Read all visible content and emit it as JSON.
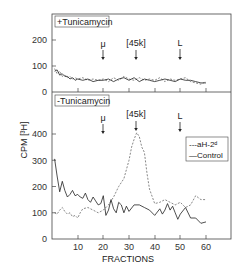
{
  "chart_data": [
    {
      "type": "line",
      "panel": "upper",
      "title": "+Tunicamycin",
      "xlabel": "",
      "ylabel": "CPM [3H]",
      "ylim": [
        0,
        280
      ],
      "yticks": [
        0,
        100,
        200
      ],
      "xlim": [
        0,
        70
      ],
      "markers": [
        {
          "label": "μ",
          "x": 20
        },
        {
          "label": "[45k]",
          "x": 33
        },
        {
          "label": "L",
          "x": 50
        }
      ],
      "series": [
        {
          "name": "anti-H-2d",
          "style": "dashed",
          "x": [
            1,
            2,
            3,
            4,
            5,
            6,
            7,
            8,
            9,
            10,
            12,
            14,
            16,
            18,
            20,
            22,
            24,
            26,
            28,
            30,
            32,
            34,
            36,
            38,
            40,
            42,
            44,
            46,
            48,
            50,
            52,
            54,
            56,
            58,
            60
          ],
          "values": [
            90,
            70,
            80,
            60,
            65,
            55,
            60,
            50,
            55,
            50,
            55,
            45,
            50,
            45,
            50,
            40,
            55,
            45,
            60,
            50,
            45,
            55,
            45,
            50,
            45,
            55,
            40,
            50,
            45,
            50,
            55,
            40,
            35,
            30,
            40
          ]
        },
        {
          "name": "Control",
          "style": "solid",
          "x": [
            1,
            2,
            3,
            4,
            5,
            6,
            7,
            8,
            9,
            10,
            12,
            14,
            16,
            18,
            20,
            22,
            24,
            26,
            28,
            30,
            32,
            34,
            36,
            38,
            40,
            42,
            44,
            46,
            48,
            50,
            52,
            54,
            56,
            58,
            60
          ],
          "values": [
            80,
            85,
            65,
            70,
            60,
            60,
            50,
            55,
            45,
            50,
            45,
            50,
            40,
            45,
            45,
            50,
            40,
            50,
            55,
            45,
            55,
            40,
            50,
            45,
            40,
            45,
            50,
            45,
            40,
            50,
            45,
            45,
            40,
            35,
            35
          ]
        }
      ]
    },
    {
      "type": "line",
      "panel": "lower",
      "title": "-Tunicamycin",
      "xlabel": "FRACTIONS",
      "ylabel": "CPM [3H]",
      "ylim": [
        0,
        500
      ],
      "yticks": [
        0,
        100,
        200,
        300,
        400
      ],
      "xticks": [
        10,
        20,
        30,
        40,
        50,
        60
      ],
      "xlim": [
        0,
        70
      ],
      "markers": [
        {
          "label": "μ",
          "x": 20
        },
        {
          "label": "[45k]",
          "x": 33
        },
        {
          "label": "L",
          "x": 50
        }
      ],
      "legend": [
        "aH-2d",
        "Control"
      ],
      "series": [
        {
          "name": "aH-2d",
          "style": "dashed",
          "x": [
            1,
            2,
            3,
            4,
            5,
            6,
            7,
            8,
            9,
            10,
            11,
            12,
            14,
            16,
            18,
            20,
            22,
            24,
            26,
            28,
            30,
            31,
            32,
            33,
            34,
            35,
            36,
            37,
            38,
            40,
            42,
            44,
            46,
            48,
            50,
            52,
            54,
            56,
            58,
            60
          ],
          "values": [
            100,
            95,
            110,
            120,
            105,
            95,
            100,
            85,
            90,
            80,
            100,
            115,
            120,
            110,
            100,
            110,
            130,
            160,
            200,
            230,
            300,
            350,
            380,
            405,
            390,
            350,
            330,
            250,
            190,
            135,
            140,
            150,
            140,
            130,
            140,
            120,
            130,
            165,
            150,
            150
          ]
        },
        {
          "name": "Control",
          "style": "solid",
          "x": [
            1,
            2,
            3,
            4,
            5,
            6,
            7,
            8,
            9,
            10,
            11,
            12,
            13,
            14,
            15,
            16,
            17,
            18,
            19,
            20,
            21,
            22,
            23,
            24,
            25,
            26,
            27,
            28,
            29,
            30,
            32,
            34,
            36,
            38,
            40,
            42,
            43,
            44,
            45,
            46,
            47,
            48,
            49,
            50,
            52,
            54,
            56,
            58,
            60
          ],
          "values": [
            305,
            240,
            180,
            220,
            185,
            160,
            170,
            185,
            165,
            170,
            160,
            155,
            175,
            150,
            140,
            160,
            145,
            130,
            135,
            165,
            90,
            110,
            150,
            115,
            100,
            140,
            130,
            100,
            125,
            105,
            130,
            130,
            120,
            110,
            90,
            115,
            95,
            110,
            135,
            110,
            125,
            100,
            75,
            95,
            120,
            80,
            80,
            60,
            65
          ]
        }
      ]
    }
  ],
  "figure": {
    "upper_panel_label": "+Tunicamycin",
    "lower_panel_label": "-Tunicamycin",
    "y_axis_label": "CPM [³H]",
    "x_axis_label": "FRACTIONS",
    "legend_dashed": "---aH-2ᵈ",
    "legend_solid": "—Control",
    "marker_mu": "μ",
    "marker_45k": "[45k]",
    "marker_L": "L",
    "upper_yticks": [
      "0",
      "100",
      "200"
    ],
    "lower_yticks": [
      "0",
      "100",
      "200",
      "300",
      "400"
    ],
    "xticks": [
      "10",
      "20",
      "30",
      "40",
      "50",
      "60"
    ]
  }
}
